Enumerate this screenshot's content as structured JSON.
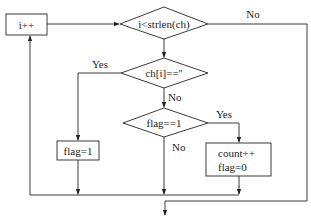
{
  "diagram": {
    "type": "flowchart",
    "nodes": {
      "increment": {
        "shape": "rectangle",
        "text": "i++"
      },
      "loop_condition": {
        "shape": "diamond",
        "text": "i<strlen(ch)"
      },
      "space_check": {
        "shape": "diamond",
        "text": "ch[i]==''"
      },
      "flag_check": {
        "shape": "diamond",
        "text": "flag==1"
      },
      "set_flag": {
        "shape": "rectangle",
        "text": "flag=1"
      },
      "count_block": {
        "shape": "rectangle",
        "lines": [
          "count++",
          "flag=0"
        ]
      }
    },
    "edge_labels": {
      "loop_no": "No",
      "space_yes": "Yes",
      "space_no": "No",
      "flag_yes": "Yes",
      "flag_no": "No"
    },
    "edges": [
      {
        "from": "increment",
        "to": "loop_condition"
      },
      {
        "from": "loop_condition",
        "to": "space_check",
        "label": ""
      },
      {
        "from": "loop_condition",
        "to": "exit",
        "label": "No"
      },
      {
        "from": "space_check",
        "to": "set_flag",
        "label": "Yes"
      },
      {
        "from": "space_check",
        "to": "flag_check",
        "label": "No"
      },
      {
        "from": "flag_check",
        "to": "count_block",
        "label": "Yes"
      },
      {
        "from": "flag_check",
        "to": "merge",
        "label": "No"
      },
      {
        "from": "set_flag",
        "to": "merge"
      },
      {
        "from": "count_block",
        "to": "merge"
      },
      {
        "from": "merge",
        "to": "increment"
      }
    ],
    "colors": {
      "line": "#3a3a3a",
      "text": "#222222",
      "background": "#ffffff"
    }
  }
}
